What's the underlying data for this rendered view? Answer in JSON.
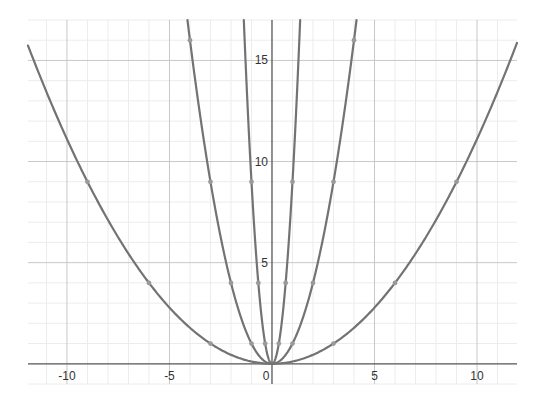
{
  "chart_data": {
    "type": "line",
    "title": "",
    "xlabel": "",
    "ylabel": "",
    "xlim": [
      -11.9,
      11.95
    ],
    "ylim": [
      -1.0,
      17.0
    ],
    "grid": true,
    "minor_grid_step": 1,
    "major_grid_step": 5,
    "x_ticks": [
      -10,
      -5,
      0,
      5,
      10
    ],
    "x_tick_labels": [
      "-10",
      "-5",
      "0",
      "5",
      "10"
    ],
    "y_ticks": [
      5,
      10,
      15
    ],
    "y_tick_labels": [
      "5",
      "10",
      "15"
    ],
    "legend": null,
    "series": [
      {
        "name": "y = x²/9",
        "coefficient": 0.1111111,
        "points": [
          [
            -9,
            9
          ],
          [
            -6,
            4
          ],
          [
            -3,
            1
          ],
          [
            0,
            0
          ],
          [
            3,
            1
          ],
          [
            6,
            4
          ],
          [
            9,
            9
          ]
        ]
      },
      {
        "name": "y = x²",
        "coefficient": 1,
        "points": [
          [
            -4,
            16
          ],
          [
            -3,
            9
          ],
          [
            -2,
            4
          ],
          [
            -1,
            1
          ],
          [
            0,
            0
          ],
          [
            1,
            1
          ],
          [
            2,
            4
          ],
          [
            3,
            9
          ],
          [
            4,
            16
          ]
        ]
      },
      {
        "name": "y = 9x²",
        "coefficient": 9,
        "points": [
          [
            -1,
            9
          ],
          [
            -0.6667,
            4
          ],
          [
            -0.3333,
            1
          ],
          [
            0,
            0
          ],
          [
            0.3333,
            1
          ],
          [
            0.6667,
            4
          ],
          [
            1,
            9
          ]
        ]
      }
    ]
  },
  "colors": {
    "curve": "#737373",
    "point": "#9a9a9a",
    "axis": "#555555",
    "major_grid": "#c8c8c8",
    "minor_grid": "#ececec",
    "background": "#ffffff"
  }
}
